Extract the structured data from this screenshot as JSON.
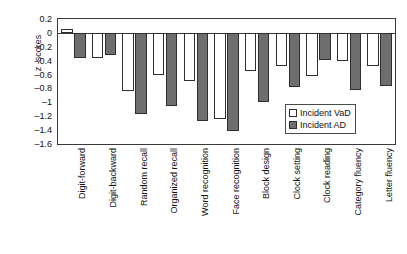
{
  "chart_data": {
    "type": "bar",
    "title": "",
    "xlabel": "",
    "ylabel": "z -scores",
    "ylim": [
      -1.6,
      0.2
    ],
    "grid": false,
    "legend_position": "inside-bottom-right",
    "y_ticks": [
      "0.2",
      "0",
      "–0.2",
      "–0.4",
      "–0.6",
      "–0.8",
      "–1",
      "–1.2",
      "–1.4",
      "–1.6"
    ],
    "y_tick_values": [
      0.2,
      0,
      -0.2,
      -0.4,
      -0.6,
      -0.8,
      -1,
      -1.2,
      -1.4,
      -1.6
    ],
    "categories": [
      "Digit-forward",
      "Digit-backward",
      "Random recall",
      "Organized recall",
      "Word recognition",
      "Face recognition",
      "Block design",
      "Clock setting",
      "Clock reading",
      "Category fluency",
      "Letter fluency"
    ],
    "series": [
      {
        "name": "Incident VaD",
        "color": "#ffffff",
        "values": [
          0.05,
          -0.36,
          -0.83,
          -0.61,
          -0.69,
          -1.24,
          -0.55,
          -0.48,
          -0.62,
          -0.41,
          -0.48
        ]
      },
      {
        "name": "Incident AD",
        "color": "#6e6e6e",
        "values": [
          -0.36,
          -0.32,
          -1.17,
          -1.05,
          -1.27,
          -1.41,
          -1.0,
          -0.78,
          -0.39,
          -0.82,
          -0.76
        ]
      }
    ]
  },
  "legend": {
    "items": [
      {
        "label": "Incident VaD",
        "swatch": "vad"
      },
      {
        "label": "Incident AD",
        "swatch": "ad"
      }
    ]
  }
}
